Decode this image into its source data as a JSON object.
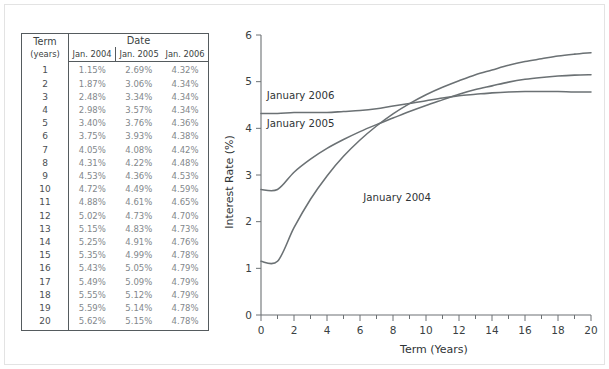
{
  "figure": {
    "background_color": "#ffffff",
    "frame_color": "#e3e3e3"
  },
  "table": {
    "headers": {
      "term": "Term",
      "term_unit": "(years)",
      "date_group": "Date",
      "columns": [
        "Jan. 2004",
        "Jan. 2005",
        "Jan. 2006"
      ]
    },
    "rows": [
      {
        "term": "1",
        "jan2004": "1.15%",
        "jan2005": "2.69%",
        "jan2006": "4.32%"
      },
      {
        "term": "2",
        "jan2004": "1.87%",
        "jan2005": "3.06%",
        "jan2006": "4.34%"
      },
      {
        "term": "3",
        "jan2004": "2.48%",
        "jan2005": "3.34%",
        "jan2006": "4.34%"
      },
      {
        "term": "4",
        "jan2004": "2.98%",
        "jan2005": "3.57%",
        "jan2006": "4.34%"
      },
      {
        "term": "5",
        "jan2004": "3.40%",
        "jan2005": "3.76%",
        "jan2006": "4.36%"
      },
      {
        "term": "6",
        "jan2004": "3.75%",
        "jan2005": "3.93%",
        "jan2006": "4.38%"
      },
      {
        "term": "7",
        "jan2004": "4.05%",
        "jan2005": "4.08%",
        "jan2006": "4.42%"
      },
      {
        "term": "8",
        "jan2004": "4.31%",
        "jan2005": "4.22%",
        "jan2006": "4.48%"
      },
      {
        "term": "9",
        "jan2004": "4.53%",
        "jan2005": "4.36%",
        "jan2006": "4.53%"
      },
      {
        "term": "10",
        "jan2004": "4.72%",
        "jan2005": "4.49%",
        "jan2006": "4.59%"
      },
      {
        "term": "11",
        "jan2004": "4.88%",
        "jan2005": "4.61%",
        "jan2006": "4.65%"
      },
      {
        "term": "12",
        "jan2004": "5.02%",
        "jan2005": "4.73%",
        "jan2006": "4.70%"
      },
      {
        "term": "13",
        "jan2004": "5.15%",
        "jan2005": "4.83%",
        "jan2006": "4.73%"
      },
      {
        "term": "14",
        "jan2004": "5.25%",
        "jan2005": "4.91%",
        "jan2006": "4.76%"
      },
      {
        "term": "15",
        "jan2004": "5.35%",
        "jan2005": "4.99%",
        "jan2006": "4.78%"
      },
      {
        "term": "16",
        "jan2004": "5.43%",
        "jan2005": "5.05%",
        "jan2006": "4.79%"
      },
      {
        "term": "17",
        "jan2004": "5.49%",
        "jan2005": "5.09%",
        "jan2006": "4.79%"
      },
      {
        "term": "18",
        "jan2004": "5.55%",
        "jan2005": "5.12%",
        "jan2006": "4.79%"
      },
      {
        "term": "19",
        "jan2004": "5.59%",
        "jan2005": "5.14%",
        "jan2006": "4.78%"
      },
      {
        "term": "20",
        "jan2004": "5.62%",
        "jan2005": "5.15%",
        "jan2006": "4.78%"
      }
    ]
  },
  "chart_data": {
    "type": "line",
    "title": "",
    "xlabel": "Term (Years)",
    "ylabel": "Interest Rate (%)",
    "xlim": [
      0,
      20
    ],
    "ylim": [
      0,
      6
    ],
    "xticks": [
      0,
      2,
      4,
      6,
      8,
      10,
      12,
      14,
      16,
      18,
      20
    ],
    "xtick_labels": [
      "0",
      "2",
      "4",
      "6",
      "8",
      "10",
      "12",
      "14",
      "16",
      "18",
      "20"
    ],
    "xminor_step": 1,
    "yticks": [
      0,
      1,
      2,
      3,
      4,
      5,
      6
    ],
    "ytick_labels": [
      "0",
      "1",
      "2",
      "3",
      "4",
      "5",
      "6"
    ],
    "grid": false,
    "legend_position": "inline-annotations",
    "line_color": "#6b7174",
    "x": [
      0,
      1,
      2,
      3,
      4,
      5,
      6,
      7,
      8,
      9,
      10,
      11,
      12,
      13,
      14,
      15,
      16,
      17,
      18,
      19,
      20
    ],
    "series": [
      {
        "name": "January 2004",
        "label": "January 2004",
        "label_x": 6.2,
        "label_y": 2.45,
        "values": [
          1.15,
          1.15,
          1.87,
          2.48,
          2.98,
          3.4,
          3.75,
          4.05,
          4.31,
          4.53,
          4.72,
          4.88,
          5.02,
          5.15,
          5.25,
          5.35,
          5.43,
          5.49,
          5.55,
          5.59,
          5.62
        ]
      },
      {
        "name": "January 2005",
        "label": "January 2005",
        "label_x": 0.35,
        "label_y": 4.02,
        "values": [
          2.69,
          2.69,
          3.06,
          3.34,
          3.57,
          3.76,
          3.93,
          4.08,
          4.22,
          4.36,
          4.49,
          4.61,
          4.73,
          4.83,
          4.91,
          4.99,
          5.05,
          5.09,
          5.12,
          5.14,
          5.15
        ]
      },
      {
        "name": "January 2006",
        "label": "January 2006",
        "label_x": 0.35,
        "label_y": 4.62,
        "values": [
          4.32,
          4.32,
          4.34,
          4.34,
          4.34,
          4.36,
          4.38,
          4.42,
          4.48,
          4.53,
          4.59,
          4.65,
          4.7,
          4.73,
          4.76,
          4.78,
          4.79,
          4.79,
          4.79,
          4.78,
          4.78
        ]
      }
    ]
  }
}
